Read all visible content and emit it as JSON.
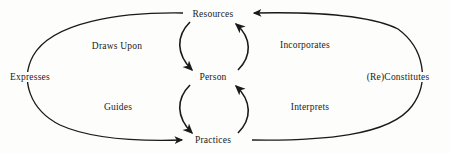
{
  "diagram": {
    "type": "cyclic-relationship-diagram",
    "background_color": "#fdfdfc",
    "stroke_color": "#1a1a1a",
    "nodes": [
      {
        "id": "resources",
        "label": "Resources",
        "x": 213,
        "y": 14
      },
      {
        "id": "person",
        "label": "Person",
        "x": 213,
        "y": 77
      },
      {
        "id": "practices",
        "label": "Practices",
        "x": 213,
        "y": 140
      }
    ],
    "edges": [
      {
        "id": "draws-upon",
        "label": "Draws Upon",
        "from": "resources",
        "to": "person",
        "label_x": 117,
        "label_y": 46,
        "style": "inner-curve-left"
      },
      {
        "id": "incorporates",
        "label": "Incorporates",
        "from": "person",
        "to": "resources",
        "label_x": 305,
        "label_y": 45,
        "style": "inner-curve-right"
      },
      {
        "id": "guides",
        "label": "Guides",
        "from": "person",
        "to": "practices",
        "label_x": 118,
        "label_y": 107,
        "style": "inner-curve-left"
      },
      {
        "id": "interprets",
        "label": "Interprets",
        "from": "practices",
        "to": "person",
        "label_x": 310,
        "label_y": 107,
        "style": "inner-curve-right"
      },
      {
        "id": "expresses",
        "label": "Expresses",
        "from": "resources",
        "to": "practices",
        "label_x": 30,
        "label_y": 77,
        "style": "outer-arc-left"
      },
      {
        "id": "re-constitutes",
        "label": "(Re)Constitutes",
        "from": "practices",
        "to": "resources",
        "label_x": 398,
        "label_y": 77,
        "style": "outer-arc-right"
      }
    ]
  }
}
